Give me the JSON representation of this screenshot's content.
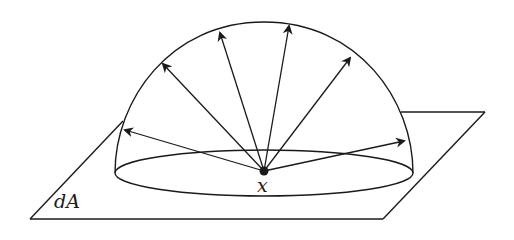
{
  "figure": {
    "labels": {
      "area": "dA",
      "point": "x"
    },
    "colors": {
      "stroke": "#1a1a1a",
      "background": "#ffffff"
    },
    "arrow_count": 6
  }
}
